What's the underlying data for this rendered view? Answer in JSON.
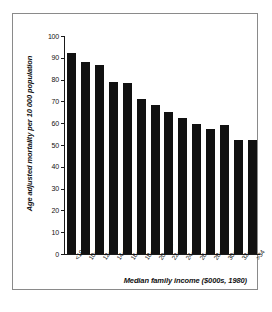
{
  "chart_data": {
    "type": "bar",
    "title": "",
    "subtitle": "",
    "xlabel": "Median family income ($000s, 1980)",
    "ylabel": "Age adjusted mortality per 10 000 population",
    "categories": [
      "<10",
      "10-<12",
      "12-<14",
      "14-<16",
      "16-<18",
      "18-<20",
      "20-<22",
      "22-<24",
      "24-<26",
      "26-<28",
      "28-<30",
      "30-<32",
      "32-<34",
      ">34"
    ],
    "values": [
      92,
      88,
      86.5,
      79,
      78.5,
      71,
      68.5,
      65,
      62.5,
      59.5,
      57.5,
      59,
      52.5,
      52.5
    ],
    "ylim": [
      0,
      100
    ],
    "yticks": [
      0,
      10,
      20,
      30,
      40,
      50,
      60,
      70,
      80,
      90,
      100
    ],
    "ytick_labels": [
      "0",
      "10",
      "20",
      "30",
      "40",
      "50",
      "60",
      "70",
      "80",
      "90",
      "100"
    ],
    "grid": false,
    "legend": null,
    "bar_color": "#111111",
    "axis_color": "#1a1a1a",
    "frame_color": "#8a8a8a",
    "background": "#ffffff"
  }
}
